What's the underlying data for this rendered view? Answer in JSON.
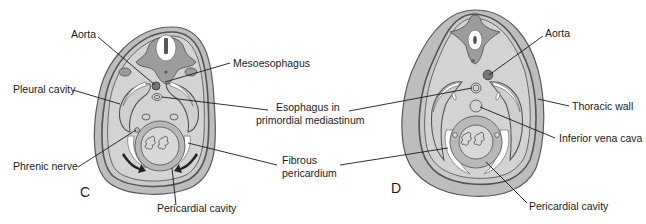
{
  "figure": {
    "panels": [
      {
        "id": "C",
        "letter": "C",
        "labels": {
          "aorta": "Aorta",
          "mesoesophagus": "Mesoesophagus",
          "pleural_cavity": "Pleural cavity",
          "esophagus_line1": "Esophagus in",
          "esophagus_line2": "primordial mediastinum",
          "phrenic_nerve": "Phrenic nerve",
          "fibrous_line1": "Fibrous",
          "fibrous_line2": "pericardium",
          "pericardial_cavity": "Pericardial cavity"
        }
      },
      {
        "id": "D",
        "letter": "D",
        "labels": {
          "aorta": "Aorta",
          "thoracic_wall": "Thoracic wall",
          "inferior_vena_cava": "Inferior vena cava",
          "pericardial_cavity": "Pericardial cavity"
        }
      }
    ],
    "colors": {
      "tissue_light": "#d3d3d3",
      "tissue_mid": "#bdbdbd",
      "tissue_dark": "#9c9c9c",
      "outline": "#555555",
      "text": "#1a1a1a"
    }
  }
}
